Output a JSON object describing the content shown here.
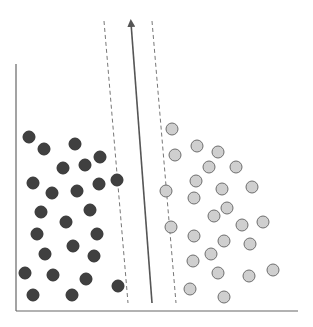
{
  "diagram": {
    "type": "svm-margin-illustration",
    "colors": {
      "background": "#ffffff",
      "axis": "#666666",
      "class_a_fill": "#404040",
      "class_a_stroke": "#333333",
      "class_b_fill": "#cfcfcf",
      "class_b_stroke": "#6e6e6e",
      "hyperplane": "#555555",
      "margin": "#777777"
    },
    "axes": {
      "y_axis": {
        "x": 16,
        "y1": 64,
        "y2": 311
      },
      "x_axis": {
        "y": 311,
        "x1": 16,
        "x2": 298
      }
    },
    "hyperplane": {
      "x1": 152,
      "y1": 303,
      "x2": 131,
      "y2": 23,
      "arrow": true
    },
    "margin_lines": [
      {
        "name": "left-margin",
        "x1": 104,
        "y1": 21,
        "x2": 128,
        "y2": 303
      },
      {
        "name": "right-margin",
        "x1": 152,
        "y1": 21,
        "x2": 176,
        "y2": 303
      }
    ],
    "point_radius": 6,
    "class_a_points": [
      [
        29,
        137
      ],
      [
        44,
        149
      ],
      [
        75,
        144
      ],
      [
        100,
        157
      ],
      [
        85,
        165
      ],
      [
        63,
        168
      ],
      [
        33,
        183
      ],
      [
        52,
        193
      ],
      [
        77,
        191
      ],
      [
        99,
        184
      ],
      [
        117,
        180
      ],
      [
        41,
        212
      ],
      [
        90,
        210
      ],
      [
        66,
        222
      ],
      [
        37,
        234
      ],
      [
        97,
        234
      ],
      [
        73,
        246
      ],
      [
        45,
        254
      ],
      [
        94,
        256
      ],
      [
        25,
        273
      ],
      [
        53,
        275
      ],
      [
        86,
        279
      ],
      [
        118,
        286
      ],
      [
        33,
        295
      ],
      [
        72,
        295
      ]
    ],
    "class_b_points": [
      [
        172,
        129
      ],
      [
        197,
        146
      ],
      [
        218,
        152
      ],
      [
        175,
        155
      ],
      [
        209,
        167
      ],
      [
        236,
        167
      ],
      [
        196,
        181
      ],
      [
        166,
        191
      ],
      [
        222,
        189
      ],
      [
        252,
        187
      ],
      [
        194,
        198
      ],
      [
        227,
        208
      ],
      [
        214,
        216
      ],
      [
        242,
        225
      ],
      [
        263,
        222
      ],
      [
        171,
        227
      ],
      [
        194,
        236
      ],
      [
        224,
        241
      ],
      [
        250,
        244
      ],
      [
        211,
        254
      ],
      [
        193,
        261
      ],
      [
        218,
        273
      ],
      [
        249,
        276
      ],
      [
        273,
        270
      ],
      [
        190,
        289
      ],
      [
        224,
        297
      ]
    ]
  }
}
